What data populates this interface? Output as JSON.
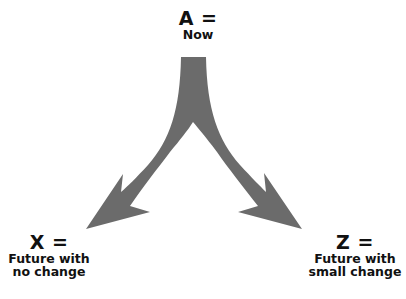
{
  "diagram": {
    "type": "branching-arrow",
    "arrow_color": "#6b6b6b",
    "nodes": {
      "a": {
        "title": "A =",
        "subtitle": [
          "Now"
        ]
      },
      "x": {
        "title": "X =",
        "subtitle": [
          "Future with",
          "no change"
        ]
      },
      "z": {
        "title": "Z =",
        "subtitle": [
          "Future with",
          "small change"
        ]
      }
    },
    "edges": [
      {
        "from": "a",
        "to": "x"
      },
      {
        "from": "a",
        "to": "z"
      }
    ]
  }
}
